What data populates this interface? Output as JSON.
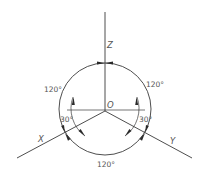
{
  "diagram": {
    "title": "",
    "type": "isometric-axes",
    "origin_label": "O",
    "axes": [
      {
        "id": "z",
        "label": "Z"
      },
      {
        "id": "x",
        "label": "X"
      },
      {
        "id": "y",
        "label": "Y"
      }
    ],
    "angles": {
      "top_left": "120°",
      "top_right": "120°",
      "bottom": "120°",
      "left_small": "30°",
      "right_small": "30°"
    },
    "colors": {
      "line": "#3a3a3a",
      "text": "#555555",
      "background": "#ffffff"
    }
  }
}
